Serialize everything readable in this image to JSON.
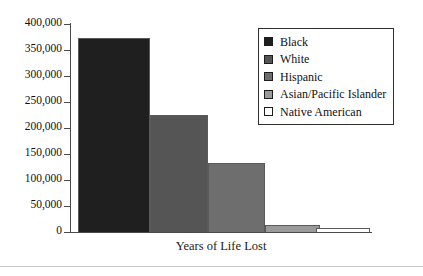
{
  "chart_data": {
    "type": "bar",
    "title": "",
    "xlabel": "Years of Life Lost",
    "ylabel": "",
    "categories": [
      "Black",
      "White",
      "Hispanic",
      "Asian/Pacific Islander",
      "Native American"
    ],
    "values": [
      373000,
      225000,
      133000,
      14000,
      8000
    ],
    "ylim": [
      0,
      400000
    ],
    "ytick_values": [
      400000,
      350000,
      300000,
      250000,
      200000,
      150000,
      100000,
      50000,
      0
    ],
    "ytick_labels": [
      "400,000",
      "350,000",
      "300,000",
      "250,000",
      "200,000",
      "150,000",
      "100,000",
      "50,000",
      "0"
    ],
    "grid": false,
    "legend_position": "upper right",
    "series": [
      {
        "name": "Years of Life Lost",
        "values": [
          373000,
          225000,
          133000,
          14000,
          8000
        ]
      }
    ],
    "bar_colors": [
      "#1f1f1f",
      "#555555",
      "#6e6e6e",
      "#9a9a9a",
      "#ffffff"
    ]
  },
  "legend": {
    "items": [
      {
        "label": "Black",
        "color": "#1f1f1f"
      },
      {
        "label": "White",
        "color": "#555555"
      },
      {
        "label": "Hispanic",
        "color": "#6e6e6e"
      },
      {
        "label": "Asian/Pacific Islander",
        "color": "#9a9a9a"
      },
      {
        "label": "Native American",
        "color": "#ffffff"
      }
    ]
  },
  "axis": {
    "x_title": "Years of Life Lost"
  }
}
